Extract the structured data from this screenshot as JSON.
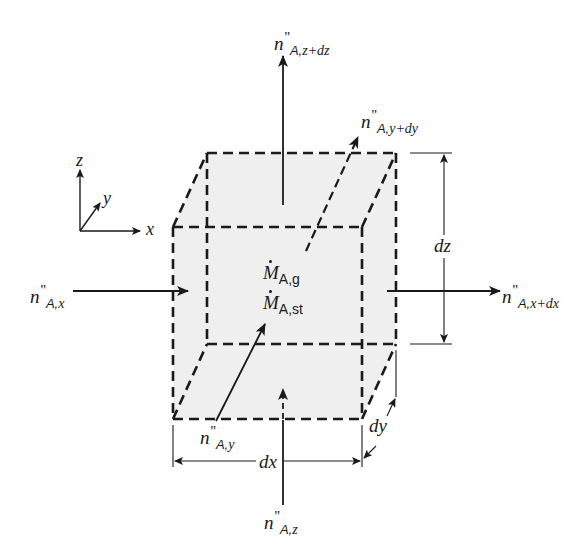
{
  "diagram": {
    "type": "differential control volume - species mass balance",
    "colors": {
      "line": "#1a1a1a",
      "volume_fill": "#efefef",
      "background": "#ffffff"
    },
    "axes": {
      "x_label": "x",
      "y_label": "y",
      "z_label": "z"
    },
    "dimensions": {
      "dx_label": "dx",
      "dy_label": "dy",
      "dz_label": "dz"
    },
    "fluxes": {
      "in_x": {
        "symbol": "n",
        "prime": "''",
        "subscript_species": "A,",
        "subscript_var": "x"
      },
      "out_x": {
        "symbol": "n",
        "prime": "''",
        "subscript_species": "A,",
        "subscript_var": "x+dx"
      },
      "in_y": {
        "symbol": "n",
        "prime": "''",
        "subscript_species": "A,",
        "subscript_var": "y"
      },
      "out_y": {
        "symbol": "n",
        "prime": "''",
        "subscript_species": "A,",
        "subscript_var": "y+dy"
      },
      "in_z": {
        "symbol": "n",
        "prime": "''",
        "subscript_species": "A,",
        "subscript_var": "z"
      },
      "out_z": {
        "symbol": "n",
        "prime": "''",
        "subscript_species": "A,",
        "subscript_var": "z+dz"
      }
    },
    "terms": {
      "generation": {
        "symbol": "M",
        "subscript": "A,g"
      },
      "storage": {
        "symbol": "M",
        "subscript": "A,st"
      }
    }
  }
}
